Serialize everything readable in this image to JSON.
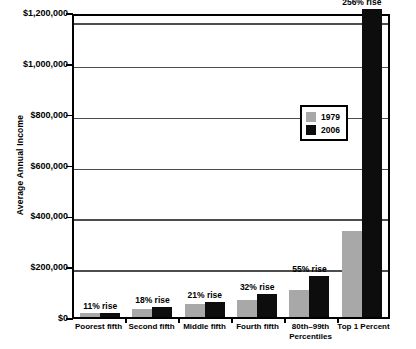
{
  "chart_data": {
    "type": "bar",
    "title": "",
    "xlabel": "",
    "ylabel": "Average Annual Income",
    "ylim": [
      0,
      1200000
    ],
    "ytick_labels": [
      "$1,200,000",
      "$1,000,000",
      "$800,000",
      "$600,000",
      "$400,000",
      "$200,000",
      "$0"
    ],
    "ytick_values": [
      1200000,
      1000000,
      800000,
      600000,
      400000,
      200000,
      0
    ],
    "grid": true,
    "legend_position": "upper right inside",
    "categories": [
      "Poorest fifth",
      "Second fifth",
      "Middle fifth",
      "Fourth fifth",
      "80th–99th\nPercentiles",
      "Top 1 Percent"
    ],
    "categories_display": [
      [
        "Poorest fifth"
      ],
      [
        "Second fifth"
      ],
      [
        "Middle fifth"
      ],
      [
        "Fourth fifth"
      ],
      [
        "80th–99th",
        "Percentiles"
      ],
      [
        "Top 1 Percent"
      ]
    ],
    "series": [
      {
        "name": "1979",
        "color": "#a8a8a8",
        "values": [
          15000,
          33000,
          50000,
          68000,
          105000,
          340000
        ]
      },
      {
        "name": "2006",
        "color": "#0d0d0d",
        "values": [
          16500,
          39000,
          60500,
          90000,
          163000,
          1210000
        ]
      }
    ],
    "annotations": [
      "11% rise",
      "18% rise",
      "21% rise",
      "32% rise",
      "55% rise",
      "256% rise"
    ]
  },
  "legend": {
    "items": [
      {
        "label": "1979",
        "color": "#a8a8a8"
      },
      {
        "label": "2006",
        "color": "#0d0d0d"
      }
    ]
  }
}
